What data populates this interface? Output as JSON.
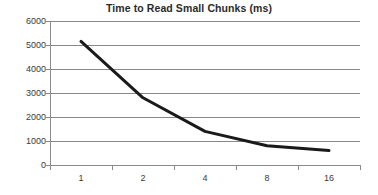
{
  "chart_data": {
    "type": "line",
    "title": "Time to Read Small Chunks (ms)",
    "xlabel": "",
    "ylabel": "",
    "categories": [
      "1",
      "2",
      "4",
      "8",
      "16"
    ],
    "x": [
      1,
      2,
      4,
      8,
      16
    ],
    "values": [
      5150,
      2800,
      1400,
      800,
      600
    ],
    "series": [
      {
        "name": "Time to Read Small Chunks (ms)",
        "values": [
          5150,
          2800,
          1400,
          800,
          600
        ]
      }
    ],
    "ylim": [
      0,
      6000
    ],
    "ytick_labels": [
      "0",
      "1000",
      "2000",
      "3000",
      "4000",
      "5000",
      "6000"
    ],
    "ytick_values": [
      0,
      1000,
      2000,
      3000,
      4000,
      5000,
      6000
    ],
    "xtick_labels": [
      "1",
      "2",
      "4",
      "8",
      "16"
    ],
    "grid": "horizontal",
    "legend": "none",
    "line_color": "#1a1a1a",
    "grid_color": "#888888",
    "axis_color": "#8a8a8a",
    "title_color": "#2b2b2b",
    "background_color": "#ffffff",
    "markers": "none"
  }
}
